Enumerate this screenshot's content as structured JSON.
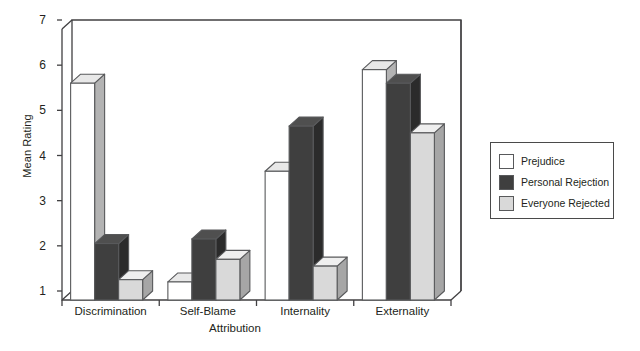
{
  "chart_data": {
    "type": "bar",
    "title": "",
    "subtitle": "",
    "xlabel": "Attribution",
    "ylabel": "Mean Rating",
    "categories": [
      "Discrimination",
      "Self-Blame",
      "Internality",
      "Externality"
    ],
    "series": [
      {
        "name": "Prejudice",
        "color": "#ffffff",
        "values": [
          5.8,
          1.4,
          3.85,
          6.1
        ]
      },
      {
        "name": "Personal Rejection",
        "color": "#3f3f3f",
        "values": [
          2.25,
          2.35,
          4.85,
          5.8
        ]
      },
      {
        "name": "Everyone Rejected",
        "color": "#d9d9d9",
        "values": [
          1.45,
          1.9,
          1.75,
          4.7
        ]
      }
    ],
    "ylim": [
      1,
      7
    ],
    "yticks": [
      1,
      2,
      3,
      4,
      5,
      6,
      7
    ],
    "ytick_labels": [
      "1",
      "2",
      "3",
      "4",
      "5",
      "6",
      "7"
    ],
    "grid": false,
    "legend_position": "right",
    "style": "3d-bar",
    "axis_color": "#414042",
    "bar_edge_color": "#58595b"
  },
  "legend": {
    "entries": [
      {
        "label": "Prejudice",
        "swatch": "#ffffff"
      },
      {
        "label": "Personal Rejection",
        "swatch": "#3f3f3f"
      },
      {
        "label": "Everyone Rejected",
        "swatch": "#d9d9d9"
      }
    ]
  }
}
